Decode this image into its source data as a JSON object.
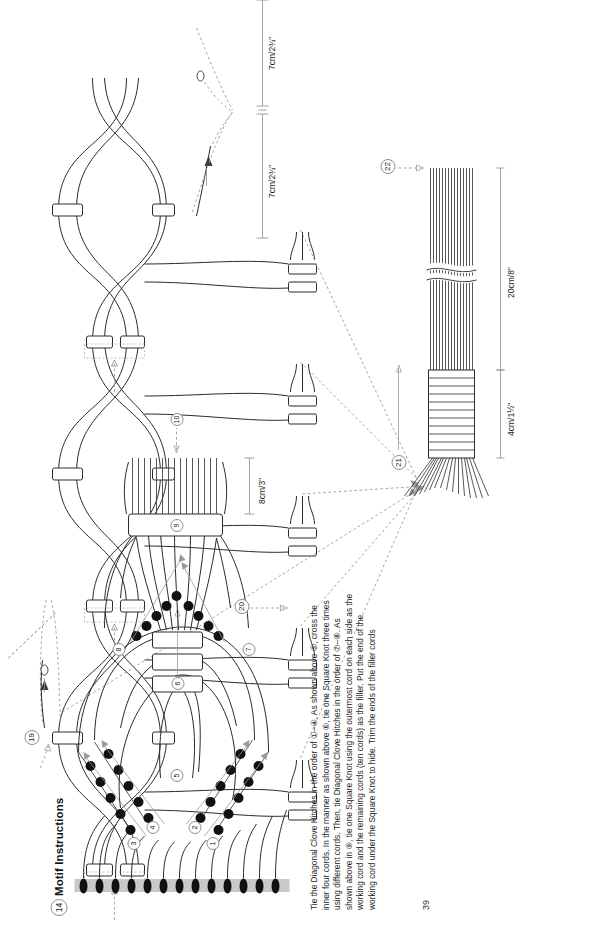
{
  "page": {
    "number": "39",
    "orientation": "rotated-90-ccw",
    "background": "#ffffff"
  },
  "motif_section": {
    "marker": "14",
    "title": "Motif Instructions",
    "step_markers": [
      "1",
      "2",
      "3",
      "4",
      "5",
      "6",
      "7",
      "8",
      "9",
      "10"
    ],
    "measurement": "8cm/3\""
  },
  "assembly_section": {
    "step_markers": [
      "19",
      "20",
      "21",
      "22"
    ],
    "measurements": {
      "span_left": "7cm/2¾\"",
      "span_right": "7cm/2¾\"",
      "wrap": "4cm/1½\"",
      "tassel": "20cm/8\""
    }
  },
  "instructions": {
    "text": "Tie the Diagonal Clove Hitches in the order of ①–④. As shown above ⑤, cross the inner four cords. In the manner as shown above ⑥, tie one Square Knot three times using different cords. Then, tie Diagonal Clove Hitches in the order of ⑦–⑧. As shown above in ⑨, tie one Square Knot using the outermost cord on each side as the working cord and the remaining cords (ten cords) as the filler. Put the end of the working cord under the Square Knot to hide. Trim the ends of the filler cords"
  },
  "colors": {
    "ink": "#2b2b2b",
    "dashed_guide": "#9a9a9a",
    "holding_cord": "#c9c9c9",
    "knot_dot": "#111111"
  }
}
